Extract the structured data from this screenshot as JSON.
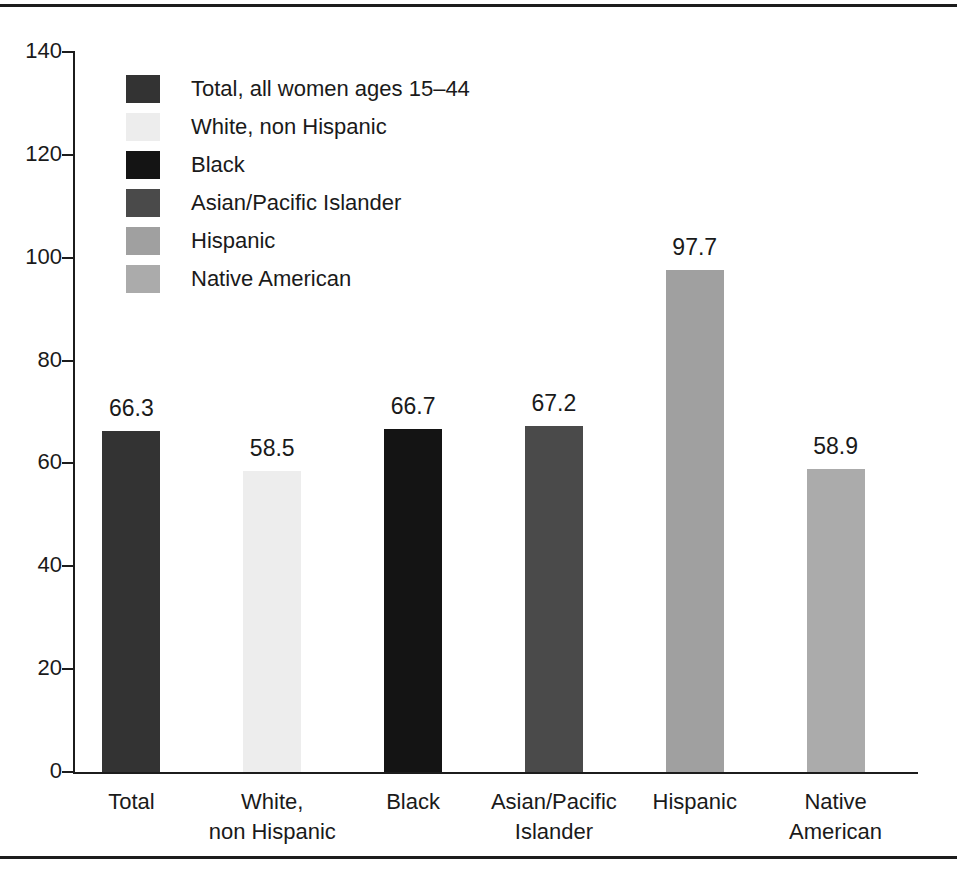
{
  "chart_data": {
    "type": "bar",
    "title": "",
    "xlabel": "",
    "ylabel": "",
    "ylim": [
      0,
      140
    ],
    "ytick_values": [
      0,
      20,
      40,
      60,
      80,
      100,
      120,
      140
    ],
    "ytick_labels": [
      "0",
      "20",
      "40",
      "60",
      "80",
      "100",
      "120",
      "140"
    ],
    "grid": false,
    "legend_position": "upper-left-inside",
    "categories": [
      "Total",
      "White,\nnon Hispanic",
      "Black",
      "Asian/Pacific\nIslander",
      "Hispanic",
      "Native\nAmerican"
    ],
    "values": [
      66.3,
      58.5,
      66.7,
      67.2,
      97.7,
      58.9
    ],
    "value_labels": [
      "66.3",
      "58.5",
      "66.7",
      "67.2",
      "97.7",
      "58.9"
    ],
    "colors": [
      "#333333",
      "#ededed",
      "#141414",
      "#4a4a4a",
      "#a0a0a0",
      "#ababab"
    ],
    "legend_entries": [
      "Total, all women ages 15–44",
      "White, non Hispanic",
      "Black",
      "Asian/Pacific Islander",
      "Hispanic",
      "Native American"
    ]
  },
  "xaxis_labels": [
    {
      "line1": "Total",
      "line2": ""
    },
    {
      "line1": "White,",
      "line2": "non Hispanic"
    },
    {
      "line1": "Black",
      "line2": ""
    },
    {
      "line1": "Asian/Pacific",
      "line2": "Islander"
    },
    {
      "line1": "Hispanic",
      "line2": ""
    },
    {
      "line1": "Native",
      "line2": "American"
    }
  ],
  "style": {
    "axis_color": "#1c1c1c",
    "text_color": "#1a1a1a",
    "background": "#ffffff",
    "rule_color": "#1c1c1c"
  }
}
